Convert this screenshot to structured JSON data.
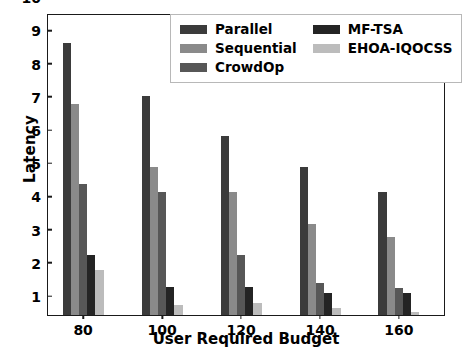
{
  "chart_data": {
    "type": "bar",
    "title": "",
    "xlabel": "User Required Budget",
    "ylabel": "Latency",
    "categories": [
      "80",
      "100",
      "120",
      "140",
      "160"
    ],
    "xtick_labels": [
      "80",
      "100",
      "120",
      "140",
      "160"
    ],
    "ytick_labels": [
      "1",
      "2",
      "3",
      "4",
      "5",
      "6",
      "7",
      "8",
      "9",
      "10"
    ],
    "ylim": [
      1,
      10
    ],
    "grid": false,
    "legend_position": "upper center",
    "legend_columns": 2,
    "series": [
      {
        "name": "Parallel",
        "color": "#3b3b3b",
        "values": [
          9.2,
          7.6,
          6.4,
          5.45,
          4.7
        ]
      },
      {
        "name": "Sequential",
        "color": "#8a8a8a",
        "values": [
          7.35,
          5.45,
          4.7,
          3.75,
          3.35
        ]
      },
      {
        "name": "CrowdOp",
        "color": "#575757",
        "values": [
          4.95,
          4.7,
          2.8,
          1.95,
          1.8
        ]
      },
      {
        "name": "MF-TSA",
        "color": "#242424",
        "values": [
          2.8,
          1.85,
          1.85,
          1.65,
          1.65
        ]
      },
      {
        "name": "EHOA-IQOCSS",
        "color": "#bcbcbc",
        "values": [
          2.35,
          1.3,
          1.35,
          1.2,
          1.1
        ]
      }
    ]
  },
  "axes": {
    "frame_color": "#1a1a1a",
    "background": "#ffffff"
  }
}
